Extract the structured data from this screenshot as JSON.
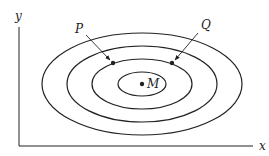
{
  "diagram": {
    "type": "contour-plot",
    "axes": {
      "x_label": "x",
      "y_label": "y"
    },
    "center_point": {
      "label": "M"
    },
    "points": [
      {
        "label": "P"
      },
      {
        "label": "Q"
      }
    ],
    "contour_count": 4
  }
}
